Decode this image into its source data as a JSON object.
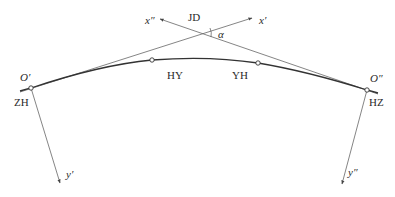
{
  "diagram": {
    "type": "transition-curve-coordinate-systems",
    "colors": {
      "line": "#555555",
      "curve": "#333333",
      "text": "#2a2a2a",
      "background": "#ffffff"
    },
    "labels": {
      "jd": "JD",
      "alpha": "α",
      "x_prime": "x′",
      "x_double_prime": "x″",
      "o_prime": "O′",
      "o_double_prime": "O″",
      "zh": "ZH",
      "hy": "HY",
      "yh": "YH",
      "hz": "HZ",
      "y_prime": "y′",
      "y_double_prime": "y″"
    },
    "points": [
      {
        "id": "ZH",
        "x": 31,
        "y": 88
      },
      {
        "id": "HY",
        "x": 152,
        "y": 60
      },
      {
        "id": "YH",
        "x": 258,
        "y": 63
      },
      {
        "id": "HZ",
        "x": 367,
        "y": 90
      },
      {
        "id": "JD",
        "x": 197,
        "y": 32
      }
    ]
  }
}
